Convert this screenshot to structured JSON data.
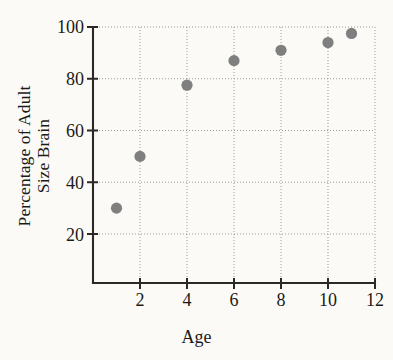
{
  "chart_data": {
    "type": "scatter",
    "title": "",
    "xlabel": "Age",
    "ylabel": "Percentage of Adult Size Brain",
    "ylabel_lines": [
      "Percentage of Adult",
      "Size Brain"
    ],
    "x": [
      1,
      2,
      4,
      6,
      8,
      10,
      11
    ],
    "values": [
      30,
      50,
      77.5,
      87,
      91,
      94,
      97.5
    ],
    "points": [
      {
        "x": 1,
        "y": 30
      },
      {
        "x": 2,
        "y": 50
      },
      {
        "x": 4,
        "y": 77.5
      },
      {
        "x": 6,
        "y": 87
      },
      {
        "x": 8,
        "y": 91
      },
      {
        "x": 10,
        "y": 94
      },
      {
        "x": 11,
        "y": 97.5
      }
    ],
    "xlim": [
      0,
      12
    ],
    "ylim": [
      12,
      100
    ],
    "xticks": [
      2,
      4,
      6,
      8,
      10,
      12
    ],
    "xtick_labels": [
      "2",
      "4",
      "6",
      "8",
      "10",
      "12"
    ],
    "yticks": [
      20,
      40,
      60,
      80,
      100
    ],
    "ytick_labels": [
      "20",
      "40",
      "60",
      "80",
      "100"
    ],
    "grid": "dotted",
    "legend": null,
    "marker_color": "#7f7f7f",
    "axis_color": "#2b2825",
    "grid_color": "#9a9a9a",
    "background_color": "#fbfaf7"
  }
}
